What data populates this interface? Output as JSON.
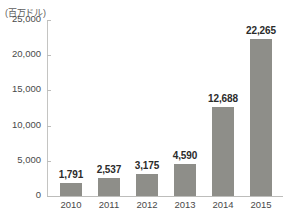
{
  "chart_data": {
    "type": "bar",
    "title": "",
    "subtitle": "",
    "unit_label": "(百万ドル)",
    "xlabel": "",
    "ylabel": "",
    "categories": [
      "2010",
      "2011",
      "2012",
      "2013",
      "2014",
      "2015"
    ],
    "values": [
      1791,
      2537,
      3175,
      4590,
      12688,
      22265
    ],
    "value_labels": [
      "1,791",
      "2,537",
      "3,175",
      "4,590",
      "12,688",
      "22,265"
    ],
    "ylim": [
      0,
      25000
    ],
    "yticks": [
      0,
      5000,
      10000,
      15000,
      20000,
      25000
    ],
    "ytick_labels": [
      "0",
      "5,000",
      "10,000",
      "15,000",
      "20,000",
      "25,000"
    ],
    "grid": false,
    "legend": null,
    "legend_position": "none",
    "series": [
      {
        "name": "",
        "values": [
          1791,
          2537,
          3175,
          4590,
          12688,
          22265
        ],
        "color": "#8e8e89"
      }
    ],
    "colors": {
      "bar": "#8e8e89",
      "axis": "#bdbdbb",
      "tick_text": "#4a4a4a",
      "value_text": "#2b2b2b",
      "background": "#ffffff"
    }
  }
}
